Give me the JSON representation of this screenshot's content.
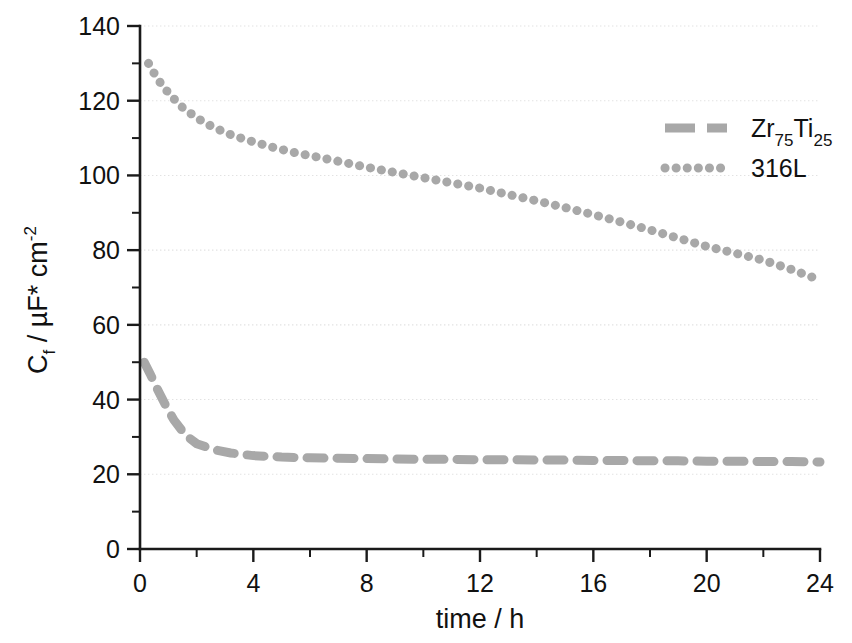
{
  "chart_data": {
    "type": "line",
    "title": "",
    "xlabel": "time / h",
    "ylabel": "C_f / µF* cm^-2",
    "ylabel_parts": {
      "main_c": "C",
      "sub_f": "f",
      "mid": " / µF* cm",
      "sup": "-2"
    },
    "xlim": [
      0,
      24
    ],
    "ylim": [
      0,
      140
    ],
    "x_ticks": [
      0,
      4,
      8,
      12,
      16,
      20,
      24
    ],
    "x_tick_labels": [
      "0",
      "4",
      "8",
      "12",
      "16",
      "20",
      "24"
    ],
    "x_minor_step": 2,
    "y_ticks": [
      0,
      20,
      40,
      60,
      80,
      100,
      120,
      140
    ],
    "y_tick_labels": [
      "0",
      "20",
      "40",
      "60",
      "80",
      "100",
      "120",
      "140"
    ],
    "y_minor_step": 10,
    "grid": "horizontal-major-dotted",
    "grid_color": "#e2e2e2",
    "legend_position": "upper-right",
    "series": [
      {
        "name": "Zr75Ti25",
        "label_parts": {
          "a": "Zr",
          "a_sub": "75",
          "b": "Ti",
          "b_sub": "25"
        },
        "style": "dashed",
        "color": "#a8a8a8",
        "x": [
          0.15,
          0.35,
          0.6,
          0.9,
          1.2,
          1.6,
          2.0,
          2.6,
          3.2,
          4.0,
          5.0,
          6.0,
          7.0,
          8.0,
          9.0,
          10.0,
          11.0,
          12.0,
          13.0,
          14.0,
          15.0,
          16.0,
          17.0,
          18.0,
          19.0,
          20.0,
          21.0,
          22.0,
          23.0,
          24.0
        ],
        "y": [
          50.0,
          47.0,
          43.0,
          38.5,
          34.5,
          30.5,
          28.2,
          26.6,
          25.7,
          25.0,
          24.6,
          24.4,
          24.3,
          24.2,
          24.1,
          24.0,
          24.0,
          23.9,
          23.9,
          23.8,
          23.8,
          23.7,
          23.7,
          23.6,
          23.6,
          23.5,
          23.5,
          23.4,
          23.4,
          23.3
        ]
      },
      {
        "name": "316L",
        "label_parts": {
          "a": "316L",
          "a_sub": "",
          "b": "",
          "b_sub": ""
        },
        "style": "dotted",
        "color": "#a8a8a8",
        "x": [
          0.3,
          0.6,
          0.9,
          1.2,
          1.5,
          1.9,
          2.3,
          2.8,
          3.3,
          4.0,
          4.7,
          5.4,
          6.2,
          7.0,
          8.0,
          9.0,
          10.0,
          11.0,
          12.0,
          13.0,
          14.0,
          15.0,
          16.0,
          17.0,
          18.0,
          19.0,
          20.0,
          21.0,
          22.0,
          23.0,
          24.0
        ],
        "y": [
          130.0,
          126.0,
          123.0,
          120.5,
          118.2,
          116.0,
          114.0,
          112.2,
          110.6,
          109.0,
          107.5,
          106.2,
          105.0,
          103.8,
          102.2,
          100.8,
          99.4,
          98.0,
          96.6,
          94.9,
          93.2,
          91.4,
          89.5,
          87.5,
          85.4,
          83.2,
          81.0,
          79.2,
          77.3,
          74.8,
          72.0
        ]
      }
    ]
  },
  "legend": {
    "entries": [
      {
        "label": "Zr75Ti25",
        "style": "dashed"
      },
      {
        "label": "316L",
        "style": "dotted"
      }
    ]
  }
}
